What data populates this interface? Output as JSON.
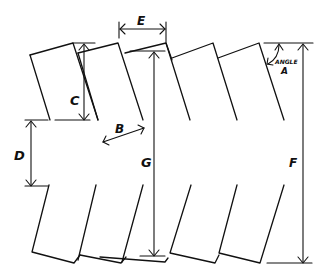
{
  "diagram": {
    "labels": {
      "a": "ANGLE",
      "a2": "A",
      "b": "B",
      "c": "C",
      "d": "D",
      "e": "E",
      "f": "F",
      "g": "G"
    },
    "stroke_color": "#111111",
    "background": "#ffffff"
  }
}
